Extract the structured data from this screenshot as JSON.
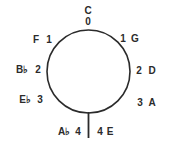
{
  "diagram": {
    "type": "circle-of-fifths",
    "top": {
      "note": "C",
      "count": "0"
    },
    "flats": [
      {
        "note": "F",
        "count": "1"
      },
      {
        "note": "B♭",
        "count": "2"
      },
      {
        "note": "E♭",
        "count": "3"
      },
      {
        "note": "A♭",
        "count": "4"
      }
    ],
    "sharps": [
      {
        "count": "1",
        "note": "G"
      },
      {
        "count": "2",
        "note": "D"
      },
      {
        "count": "3",
        "note": "A"
      },
      {
        "count": "4",
        "note": "E"
      }
    ],
    "colors": {
      "ink": "#2b2b2b",
      "background": "#ffffff"
    }
  }
}
